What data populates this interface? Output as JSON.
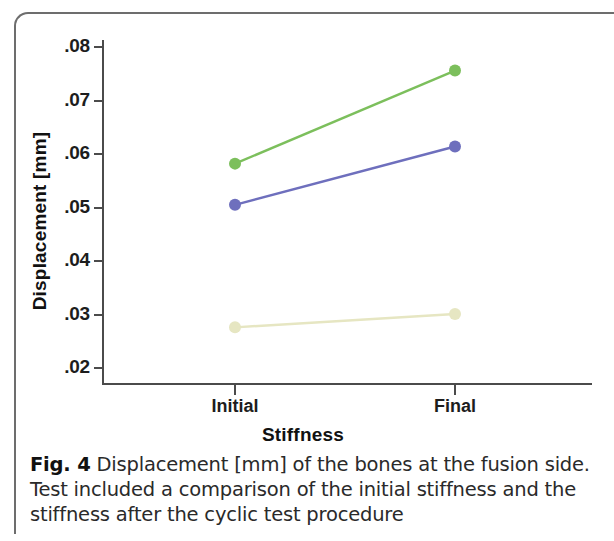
{
  "figure": {
    "caption_label": "Fig. 4",
    "caption_text": "Displacement [mm] of the bones at the fusion side. Test included a comparison of the initial stiffness and the stiffness after the cyclic test procedure"
  },
  "chart_data": {
    "type": "line",
    "title": "",
    "xlabel": "Stiffness",
    "ylabel": "Displacement [mm]",
    "categories": [
      "Initial",
      "Final"
    ],
    "x": [
      0,
      1
    ],
    "ylim": [
      0.018,
      0.084
    ],
    "yticks": [
      0.02,
      0.03,
      0.04,
      0.05,
      0.06,
      0.07,
      0.08
    ],
    "ytick_labels": [
      ".02",
      ".03",
      ".04",
      ".05",
      ".06",
      ".07",
      ".08"
    ],
    "xtick_labels": [
      "Initial",
      "Final"
    ],
    "grid": false,
    "legend": "none",
    "series": [
      {
        "name": "green-series",
        "values": [
          0.0582,
          0.0756
        ],
        "color": "#7cbf5c"
      },
      {
        "name": "blue-series",
        "values": [
          0.0505,
          0.0614
        ],
        "color": "#6e6fbd"
      },
      {
        "name": "yellow-series",
        "values": [
          0.0276,
          0.0301
        ],
        "color": "#e6e6c2"
      }
    ],
    "marker": "circle",
    "axis_color": "#4b4b4b"
  }
}
